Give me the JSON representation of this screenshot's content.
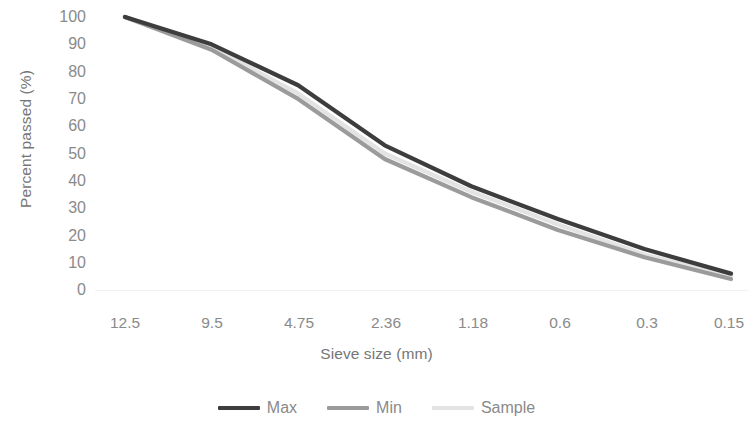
{
  "chart_data": {
    "type": "line",
    "title": "",
    "xlabel": "Sieve size (mm)",
    "ylabel": "Percent passed (%)",
    "categories": [
      "12.5",
      "9.5",
      "4.75",
      "2.36",
      "1.18",
      "0.6",
      "0.3",
      "0.15"
    ],
    "x_tick_labels": [
      "12.5",
      "9.5",
      "4.75",
      "2.36",
      "1.18",
      "0.6",
      "0.3",
      "0.15"
    ],
    "y_tick_labels": [
      "100",
      "90",
      "80",
      "70",
      "60",
      "50",
      "40",
      "30",
      "20",
      "10",
      "0"
    ],
    "y_ticks": [
      100,
      90,
      80,
      70,
      60,
      50,
      40,
      30,
      20,
      10,
      0
    ],
    "ylim": [
      0,
      100
    ],
    "grid": false,
    "legend_position": "bottom",
    "series": [
      {
        "name": "Max",
        "color": "#3d3d3d",
        "values": [
          100,
          90,
          75,
          53,
          38,
          26,
          15,
          6
        ]
      },
      {
        "name": "Min",
        "color": "#9b9b9b",
        "values": [
          100,
          88,
          70,
          48,
          34,
          22,
          12,
          4
        ]
      },
      {
        "name": "Sample",
        "color": "#e3e3e3",
        "values": [
          100,
          89,
          72,
          50,
          36,
          24,
          13,
          5
        ]
      }
    ]
  },
  "axes": {
    "x_title": "Sieve size (mm)",
    "y_title": "Percent passed (%)",
    "y_labels": {
      "t0": "100",
      "t1": "90",
      "t2": "80",
      "t3": "70",
      "t4": "60",
      "t5": "50",
      "t6": "40",
      "t7": "30",
      "t8": "20",
      "t9": "10",
      "t10": "0"
    },
    "x_labels": {
      "t0": "12.5",
      "t1": "9.5",
      "t2": "4.75",
      "t3": "2.36",
      "t4": "1.18",
      "t5": "0.6",
      "t6": "0.3",
      "t7": "0.15"
    }
  },
  "legend": {
    "items": [
      {
        "label": "Max",
        "color": "#3d3d3d"
      },
      {
        "label": "Min",
        "color": "#9b9b9b"
      },
      {
        "label": "Sample",
        "color": "#e3e3e3"
      }
    ]
  },
  "colors": {
    "max_line": "#3d3d3d",
    "min_line": "#9b9b9b",
    "sample_line": "#e3e3e3",
    "axis_text": "#8a8a8a",
    "title_text": "#767676",
    "background": "#ffffff"
  }
}
